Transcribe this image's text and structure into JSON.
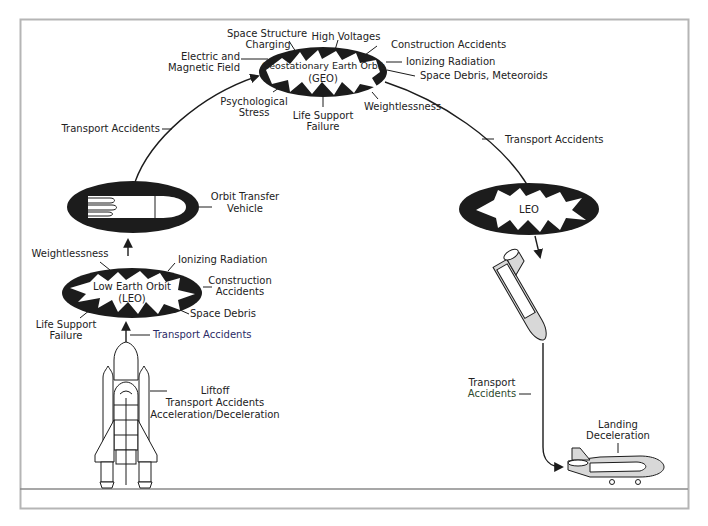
{
  "diagram": {
    "colors": {
      "frame": "#b5b5b5",
      "ink": "#1c1c1c",
      "fill_light": "#d8d8d8",
      "ground": "#888888"
    },
    "geo": {
      "name_line1": "Geostationary Earth Orbit",
      "name_line2": "(GEO)",
      "hazards": {
        "space_structure_charging_1": "Space Structure",
        "space_structure_charging_2": "Charging",
        "high_voltages": "High Voltages",
        "construction_accidents": "Construction Accidents",
        "ionizing_radiation": "Ionizing Radiation",
        "space_debris": "Space Debris, Meteoroids",
        "electric_field_1": "Electric and",
        "electric_field_2": "Magnetic Field",
        "psychological_1": "Psychological",
        "psychological_2": "Stress",
        "life_support_1": "Life Support",
        "life_support_2": "Failure",
        "weightlessness": "Weightlessness"
      }
    },
    "transfer_left": "Transport Accidents",
    "transfer_right": "Transport Accidents",
    "otv": {
      "label_1": "Orbit Transfer",
      "label_2": "Vehicle"
    },
    "leo_left": {
      "name_line1": "Low Earth Orbit",
      "name_line2": "(LEO)",
      "hazards": {
        "weightlessness": "Weightlessness",
        "ionizing_radiation": "Ionizing Radiation",
        "construction_1": "Construction",
        "construction_2": "Accidents",
        "space_debris": "Space Debris",
        "life_support_1": "Life Support",
        "life_support_2": "Failure"
      },
      "ascent_label": "Transport Accidents"
    },
    "launch": {
      "line1": "Liftoff",
      "line2": "Transport Accidents",
      "line3": "Acceleration/Deceleration"
    },
    "leo_right": {
      "name": "LEO"
    },
    "descent": {
      "line1": "Transport",
      "line2": "Accidents"
    },
    "landing": {
      "line1": "Landing",
      "line2": "Deceleration"
    }
  }
}
